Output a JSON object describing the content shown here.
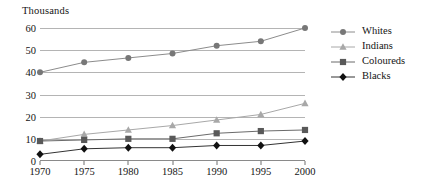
{
  "chart_data": {
    "type": "line",
    "title": "",
    "subtitle": "",
    "unit_label": "Thousands",
    "xlabel": "",
    "ylabel": "Thousands",
    "x": [
      1970,
      1975,
      1980,
      1985,
      1990,
      1995,
      2000
    ],
    "categories": [
      "1970",
      "1975",
      "1980",
      "1985",
      "1990",
      "1995",
      "2000"
    ],
    "xlim": [
      1970,
      2000
    ],
    "ylim": [
      0,
      60
    ],
    "yticks": [
      0,
      10,
      20,
      30,
      40,
      50,
      60
    ],
    "ytick_labels": [
      "0",
      "10",
      "20",
      "30",
      "40",
      "50",
      "60"
    ],
    "grid": true,
    "legend_position": "right",
    "series": [
      {
        "name": "Whites",
        "marker": "circle",
        "color": "#777777",
        "line_color": "#8c8c8c",
        "values": [
          40,
          44.5,
          46.5,
          48.5,
          52,
          54,
          60
        ]
      },
      {
        "name": "Indians",
        "marker": "triangle",
        "color": "#a8a8a8",
        "line_color": "#a8a8a8",
        "values": [
          9,
          12,
          14,
          16,
          18.5,
          21,
          26
        ]
      },
      {
        "name": "Coloureds",
        "marker": "square",
        "color": "#595959",
        "line_color": "#6b6b6b",
        "values": [
          9,
          9.5,
          10,
          10,
          12.5,
          13.5,
          14
        ]
      },
      {
        "name": "Blacks",
        "marker": "diamond",
        "color": "#111111",
        "line_color": "#333333",
        "values": [
          3,
          5.5,
          6,
          6,
          7,
          7,
          9
        ]
      }
    ]
  },
  "legend": {
    "items": [
      {
        "label": "Whites"
      },
      {
        "label": "Indians"
      },
      {
        "label": "Coloureds"
      },
      {
        "label": "Blacks"
      }
    ]
  },
  "colors": {
    "gridline": "#b4b4b4",
    "axis": "#8a8a8a",
    "text": "#141414",
    "background": "#ffffff"
  }
}
